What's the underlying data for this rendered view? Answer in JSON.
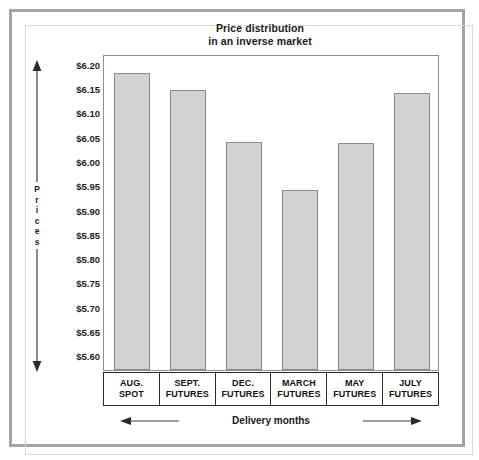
{
  "chart_data": {
    "type": "bar",
    "title": "Price distribution in an inverse market",
    "title_line1": "Price distribution",
    "title_line2": "in an inverse market",
    "xlabel": "Delivery months",
    "ylabel": "Prices",
    "ylabel_letters": [
      "P",
      "r",
      "i",
      "c",
      "e",
      "s"
    ],
    "categories": [
      "AUG. SPOT",
      "SEPT. FUTURES",
      "DEC. FUTURES",
      "MARCH FUTURES",
      "MAY FUTURES",
      "JULY FUTURES"
    ],
    "category_lines": [
      [
        "AUG.",
        "SPOT"
      ],
      [
        "SEPT.",
        "FUTURES"
      ],
      [
        "DEC.",
        "FUTURES"
      ],
      [
        "MARCH",
        "FUTURES"
      ],
      [
        "MAY",
        "FUTURES"
      ],
      [
        "JULY",
        "FUTURES"
      ]
    ],
    "values": [
      6.18,
      6.145,
      6.04,
      5.94,
      6.037,
      6.14
    ],
    "ylim": [
      5.57,
      6.22
    ],
    "ytick_values": [
      6.2,
      6.15,
      6.1,
      6.05,
      6.0,
      5.95,
      5.9,
      5.85,
      5.8,
      5.75,
      5.7,
      5.65,
      5.6
    ],
    "ytick_labels": [
      "$6.20",
      "$6.15",
      "$6.10",
      "$6.05",
      "$6.00",
      "$5.95",
      "$5.90",
      "$5.85",
      "$5.80",
      "$5.75",
      "$5.70",
      "$5.65",
      "$5.60"
    ],
    "grid": false,
    "legend": "none",
    "bar_fill": "#d2d2d2",
    "bar_stroke": "#8b8b8b",
    "frame_color": "#8f8f8f",
    "outer_border_color": "#a3a3a3",
    "text_color": "#1a1a1a"
  }
}
